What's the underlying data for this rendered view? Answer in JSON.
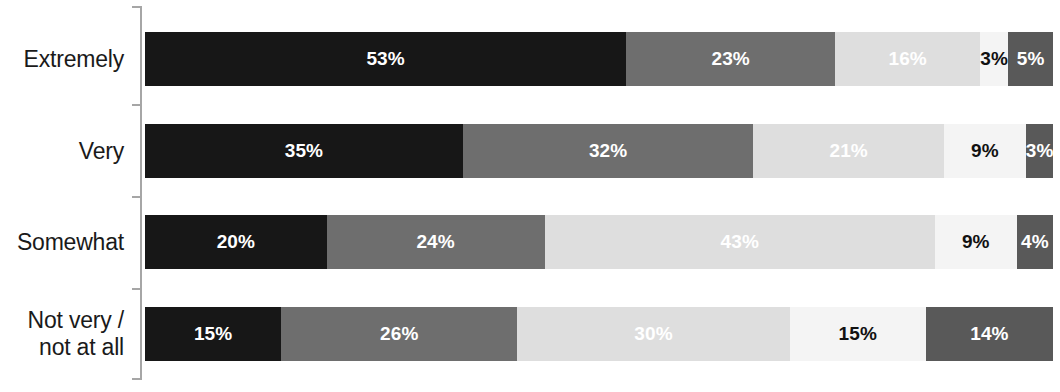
{
  "chart_data": {
    "type": "bar",
    "orientation": "horizontal",
    "stacked": true,
    "stack_mode": "percent",
    "title": "",
    "subtitle": "",
    "xlabel": "",
    "ylabel": "",
    "xlim": [
      0,
      100
    ],
    "grid": false,
    "legend_position": "none",
    "axis_line_color": "#a6a6a6",
    "categories": [
      "Extremely",
      "Very",
      "Somewhat",
      "Not very / not at all"
    ],
    "category_label_lines": [
      [
        "Extremely"
      ],
      [
        "Very"
      ],
      [
        "Somewhat"
      ],
      [
        "Not very /",
        "not at all"
      ]
    ],
    "series": [
      {
        "name": "segment-1",
        "color": "#171717",
        "label_color": "#ffffff",
        "values": [
          53,
          35,
          20,
          15
        ],
        "value_labels": [
          "53%",
          "35%",
          "20%",
          "15%"
        ]
      },
      {
        "name": "segment-2",
        "color": "#6e6e6e",
        "label_color": "#ffffff",
        "values": [
          23,
          32,
          24,
          26
        ],
        "value_labels": [
          "23%",
          "32%",
          "24%",
          "26%"
        ]
      },
      {
        "name": "segment-3",
        "color": "#dedede",
        "label_color": "#ffffff",
        "values": [
          16,
          21,
          43,
          30
        ],
        "value_labels": [
          "16%",
          "21%",
          "43%",
          "30%"
        ]
      },
      {
        "name": "segment-4",
        "color": "#f4f4f4",
        "label_color": "#111111",
        "values": [
          3,
          9,
          9,
          15
        ],
        "value_labels": [
          "3%",
          "9%",
          "9%",
          "15%"
        ]
      },
      {
        "name": "segment-5",
        "color": "#595959",
        "label_color": "#ffffff",
        "values": [
          5,
          3,
          4,
          14
        ],
        "value_labels": [
          "5%",
          "3%",
          "4%",
          "14%"
        ]
      }
    ]
  }
}
